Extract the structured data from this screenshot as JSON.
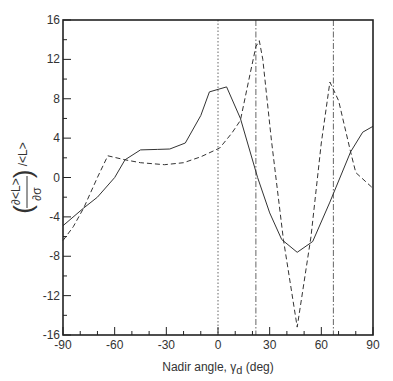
{
  "chart_data": {
    "type": "line",
    "title": "",
    "xlabel": "Nadir angle, γd (deg)",
    "xlabel_main": "Nadir angle, γ",
    "xlabel_sub": "d",
    "xlabel_unit": " (deg)",
    "ylabel": "(∂<L>/∂σ) /<L>",
    "xlim": [
      -90,
      90
    ],
    "ylim": [
      -16,
      16
    ],
    "xticks": [
      -90,
      -60,
      -30,
      0,
      30,
      60,
      90
    ],
    "yticks": [
      16,
      12,
      8,
      4,
      0,
      -4,
      -8,
      -12,
      -16
    ],
    "grid": false,
    "legend": null,
    "reference_lines": [
      {
        "x": 0,
        "style": "dotted"
      },
      {
        "x": 22,
        "style": "dash-dot"
      },
      {
        "x": 67,
        "style": "dash-dot"
      }
    ],
    "series": [
      {
        "name": "solid",
        "style": "solid",
        "x": [
          -90,
          -78,
          -70,
          -60,
          -54,
          -45,
          -35,
          -28,
          -19,
          -10,
          -5,
          5,
          13,
          23,
          30,
          37,
          46,
          55,
          65,
          77,
          84,
          90
        ],
        "y": [
          -4.9,
          -3.1,
          -2.0,
          0.0,
          1.8,
          2.8,
          2.85,
          2.9,
          3.5,
          6.3,
          8.7,
          9.2,
          6.0,
          0.0,
          -3.6,
          -6.3,
          -7.6,
          -6.5,
          -2.5,
          2.6,
          4.6,
          5.2
        ]
      },
      {
        "name": "dashed",
        "style": "dashed",
        "x": [
          -90,
          -84,
          -78,
          -70,
          -64,
          -54,
          -45,
          -31,
          -20,
          -10,
          1,
          8,
          13,
          18,
          22,
          24,
          26,
          31,
          38,
          46,
          54,
          60,
          65,
          70,
          77,
          80,
          90
        ],
        "y": [
          -6.4,
          -5.0,
          -3.1,
          0.0,
          2.2,
          1.8,
          1.5,
          1.3,
          1.5,
          2.1,
          3.0,
          4.5,
          5.8,
          10.0,
          13.3,
          13.9,
          12.0,
          3.8,
          -6.3,
          -15.2,
          -6.0,
          3.5,
          9.7,
          7.8,
          2.6,
          0.5,
          -1.1
        ]
      }
    ]
  }
}
